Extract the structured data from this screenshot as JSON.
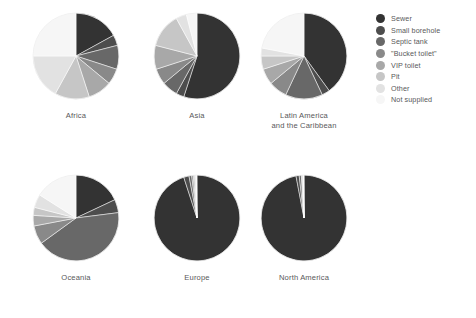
{
  "chart_data": {
    "type": "pie",
    "title": "",
    "subtitle": "",
    "xlabel": "",
    "ylabel": "",
    "grid": false,
    "legend_position": "top-right",
    "categories": [
      "Sewer",
      "Small borehole",
      "Septic tank",
      "\"Bucket toilet\"",
      "VIP toilet",
      "Pit",
      "Other",
      "Not supplied"
    ],
    "colors": [
      "#333333",
      "#4d4d4d",
      "#686868",
      "#898989",
      "#a8a8a8",
      "#c6c6c6",
      "#e2e2e2",
      "#f6f6f6"
    ],
    "charts": [
      {
        "label": "Africa",
        "label_line2": "",
        "values": [
          17,
          4,
          9,
          6,
          9,
          13,
          17,
          25
        ]
      },
      {
        "label": "Asia",
        "label_line2": "",
        "values": [
          55,
          3,
          6,
          6,
          9,
          13,
          4,
          4
        ]
      },
      {
        "label": "Latin America",
        "label_line2": "and the Caribbean",
        "values": [
          40,
          3,
          14,
          7,
          6,
          5,
          3,
          22
        ]
      },
      {
        "label": "Oceania",
        "label_line2": "",
        "values": [
          18,
          5,
          42,
          7,
          4,
          3,
          5,
          16
        ]
      },
      {
        "label": "Europe",
        "label_line2": "",
        "values": [
          95,
          2,
          1,
          0.6,
          0.5,
          0.4,
          0.3,
          0.2
        ]
      },
      {
        "label": "North America",
        "label_line2": "",
        "values": [
          97,
          1.2,
          0.8,
          0.3,
          0.3,
          0.2,
          0.1,
          0.1
        ]
      }
    ]
  },
  "legend": {
    "items": [
      {
        "label": "Sewer",
        "color": "#333333"
      },
      {
        "label": "Small borehole",
        "color": "#4d4d4d"
      },
      {
        "label": "Septic tank",
        "color": "#686868"
      },
      {
        "label": "\"Bucket toilet\"",
        "color": "#898989"
      },
      {
        "label": "VIP toilet",
        "color": "#a8a8a8"
      },
      {
        "label": "Pit",
        "color": "#c6c6c6"
      },
      {
        "label": "Other",
        "color": "#e2e2e2"
      },
      {
        "label": "Not supplied",
        "color": "#f6f6f6"
      }
    ]
  }
}
